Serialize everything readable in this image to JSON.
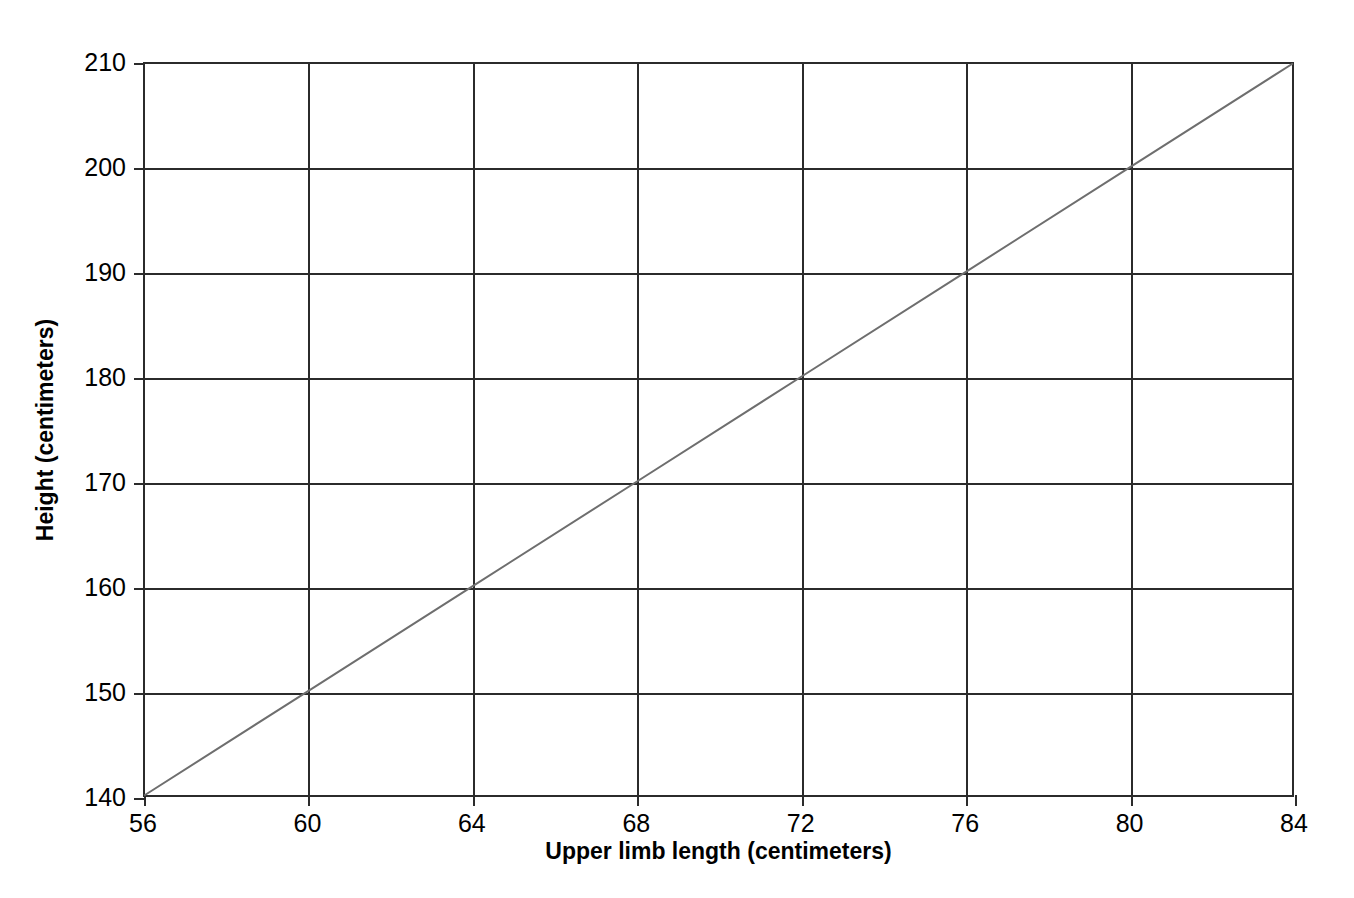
{
  "chart_data": {
    "type": "line",
    "title": "",
    "subtitle": "",
    "xlabel": "Upper limb length (centimeters)",
    "ylabel": "Height (centimeters)",
    "xlim": [
      56,
      84
    ],
    "ylim": [
      140,
      210
    ],
    "xticks": [
      56,
      60,
      64,
      68,
      72,
      76,
      80,
      84
    ],
    "yticks": [
      140,
      150,
      160,
      170,
      180,
      190,
      200,
      210
    ],
    "xticklabels": [
      "56",
      "60",
      "64",
      "68",
      "72",
      "76",
      "80",
      "84"
    ],
    "yticklabels": [
      "140",
      "150",
      "160",
      "170",
      "180",
      "190",
      "200",
      "210"
    ],
    "grid": true,
    "legend": false,
    "legend_position": "none",
    "annotations": [],
    "series": [
      {
        "name": "Height vs upper limb length",
        "color": "#6e6e6e",
        "linewidth": 2,
        "x": [
          56,
          60,
          64,
          68,
          72,
          76,
          80,
          84
        ],
        "y": [
          140,
          150,
          160,
          170,
          180,
          190,
          200,
          210
        ]
      }
    ]
  },
  "colors": {
    "background": "#ffffff",
    "axis": "#2b2b2b",
    "grid": "#2b2b2b",
    "line": "#6e6e6e",
    "text": "#000000"
  }
}
